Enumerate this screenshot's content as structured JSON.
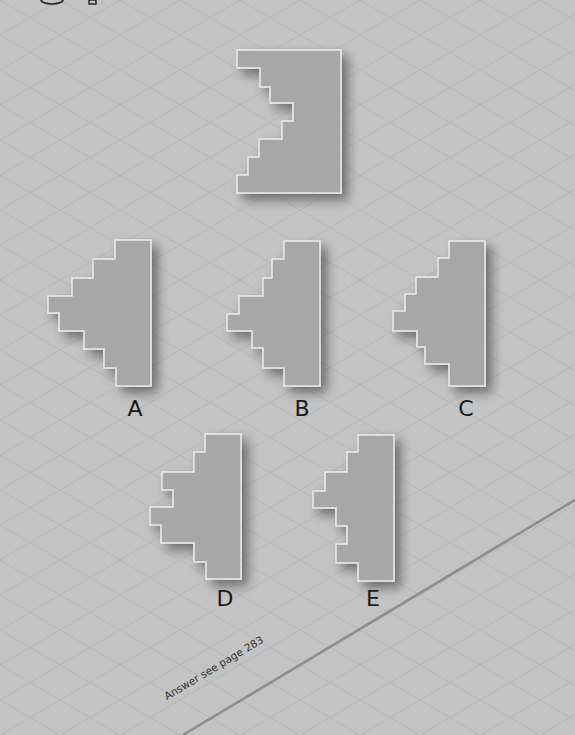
{
  "page": {
    "background_color": "#c3c3c3",
    "grid_line_color": "#b5b5b5",
    "shape_fill_color": "#a7a7a7",
    "shape_outline_color": "#ececec",
    "divider_line_color": "#8c8c8c",
    "answer_note": "Answer see page 283"
  },
  "header_fragments": [
    {
      "name": "circled-number-fragment",
      "type": "arc"
    },
    {
      "name": "digit-fragment",
      "type": "bar"
    }
  ],
  "question_shape": {
    "name": "target-shape",
    "points": [
      [
        237,
        50
      ],
      [
        341,
        50
      ],
      [
        341,
        193
      ],
      [
        237,
        193
      ],
      [
        237,
        175
      ],
      [
        248,
        175
      ],
      [
        248,
        157
      ],
      [
        259,
        157
      ],
      [
        259,
        139
      ],
      [
        282,
        139
      ],
      [
        282,
        121
      ],
      [
        293,
        121
      ],
      [
        293,
        103
      ],
      [
        270,
        103
      ],
      [
        270,
        87
      ],
      [
        260,
        87
      ],
      [
        260,
        68
      ],
      [
        237,
        68
      ]
    ]
  },
  "options": [
    {
      "label": "A",
      "label_x": 135,
      "label_y": 398,
      "points": [
        [
          115,
          240
        ],
        [
          151,
          240
        ],
        [
          151,
          386
        ],
        [
          116,
          386
        ],
        [
          116,
          368
        ],
        [
          104,
          368
        ],
        [
          104,
          349
        ],
        [
          84,
          349
        ],
        [
          84,
          331
        ],
        [
          59,
          331
        ],
        [
          59,
          313
        ],
        [
          48,
          313
        ],
        [
          48,
          296
        ],
        [
          72,
          296
        ],
        [
          72,
          278
        ],
        [
          93,
          278
        ],
        [
          93,
          259
        ],
        [
          115,
          259
        ]
      ]
    },
    {
      "label": "B",
      "label_x": 302,
      "label_y": 398,
      "points": [
        [
          284,
          241
        ],
        [
          320,
          241
        ],
        [
          320,
          386
        ],
        [
          284,
          386
        ],
        [
          284,
          368
        ],
        [
          263,
          368
        ],
        [
          263,
          348
        ],
        [
          252,
          348
        ],
        [
          252,
          331
        ],
        [
          227,
          331
        ],
        [
          227,
          314
        ],
        [
          239,
          314
        ],
        [
          239,
          296
        ],
        [
          263,
          296
        ],
        [
          263,
          278
        ],
        [
          272,
          278
        ],
        [
          272,
          259
        ],
        [
          284,
          259
        ]
      ]
    },
    {
      "label": "C",
      "label_x": 466,
      "label_y": 398,
      "points": [
        [
          449,
          241
        ],
        [
          485,
          241
        ],
        [
          485,
          386
        ],
        [
          449,
          386
        ],
        [
          449,
          364
        ],
        [
          425,
          364
        ],
        [
          425,
          347
        ],
        [
          417,
          347
        ],
        [
          417,
          331
        ],
        [
          393,
          331
        ],
        [
          393,
          311
        ],
        [
          405,
          311
        ],
        [
          405,
          294
        ],
        [
          416,
          294
        ],
        [
          416,
          277
        ],
        [
          438,
          277
        ],
        [
          438,
          258
        ],
        [
          449,
          258
        ]
      ]
    },
    {
      "label": "D",
      "label_x": 225,
      "label_y": 588,
      "points": [
        [
          205,
          434
        ],
        [
          241,
          434
        ],
        [
          241,
          579
        ],
        [
          206,
          579
        ],
        [
          206,
          562
        ],
        [
          194,
          562
        ],
        [
          194,
          543
        ],
        [
          161,
          543
        ],
        [
          161,
          525
        ],
        [
          150,
          525
        ],
        [
          150,
          507
        ],
        [
          173,
          507
        ],
        [
          173,
          490
        ],
        [
          162,
          490
        ],
        [
          162,
          472
        ],
        [
          194,
          472
        ],
        [
          194,
          452
        ],
        [
          205,
          452
        ]
      ]
    },
    {
      "label": "E",
      "label_x": 373,
      "label_y": 588,
      "points": [
        [
          358,
          435
        ],
        [
          394,
          435
        ],
        [
          394,
          581
        ],
        [
          358,
          581
        ],
        [
          358,
          563
        ],
        [
          336,
          563
        ],
        [
          336,
          544
        ],
        [
          347,
          544
        ],
        [
          347,
          526
        ],
        [
          336,
          526
        ],
        [
          336,
          508
        ],
        [
          313,
          508
        ],
        [
          313,
          491
        ],
        [
          325,
          491
        ],
        [
          325,
          472
        ],
        [
          347,
          472
        ],
        [
          347,
          452
        ],
        [
          358,
          452
        ]
      ]
    }
  ],
  "divider_line": {
    "x1": 183,
    "y1": 735,
    "x2": 575,
    "y2": 500
  }
}
